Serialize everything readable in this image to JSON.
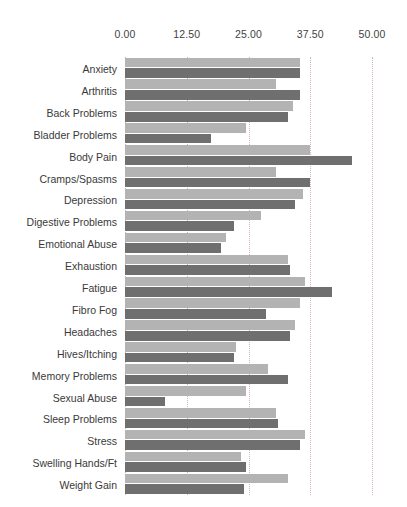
{
  "chart_data": {
    "type": "bar",
    "orientation": "horizontal",
    "title": "",
    "subtitle": "",
    "xlabel": "",
    "ylabel": "",
    "xlim": [
      0,
      50
    ],
    "xticks": [
      "0.00",
      "12.50",
      "25.00",
      "37.50",
      "50.00"
    ],
    "xtick_values": [
      0,
      12.5,
      25,
      37.5,
      50
    ],
    "grid": true,
    "grid_axis": "x",
    "legend": "none",
    "bar_colors": {
      "series_1_light": "#b3b3b3",
      "series_2_dark": "#6f6f6f",
      "gridline": "#c9a9a9",
      "background": "#ffffff",
      "text": "#3a3a3a"
    },
    "categories": [
      "Anxiety",
      "Arthritis",
      "Back Problems",
      "Bladder Problems",
      "Body Pain",
      "Cramps/Spasms",
      "Depression",
      "Digestive Problems",
      "Emotional Abuse",
      "Exhaustion",
      "Fatigue",
      "Fibro Fog",
      "Headaches",
      "Hives/Itching",
      "Memory Problems",
      "Sexual Abuse",
      "Sleep Problems",
      "Stress",
      "Swelling Hands/Ft",
      "Weight Gain"
    ],
    "series": [
      {
        "name": "Series 1",
        "color": "#b3b3b3",
        "values": [
          35.5,
          30.5,
          34.0,
          24.5,
          37.5,
          30.5,
          36.0,
          27.5,
          20.5,
          33.0,
          36.5,
          35.5,
          34.5,
          22.5,
          29.0,
          24.5,
          30.5,
          36.5,
          23.5,
          33.0
        ]
      },
      {
        "name": "Series 2",
        "color": "#6f6f6f",
        "values": [
          35.5,
          35.5,
          33.0,
          17.5,
          46.0,
          37.5,
          34.5,
          22.0,
          19.5,
          33.5,
          42.0,
          28.5,
          33.5,
          22.0,
          33.0,
          8.0,
          31.0,
          35.5,
          24.5,
          24.0
        ]
      }
    ]
  }
}
